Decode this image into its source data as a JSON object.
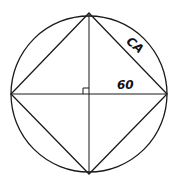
{
  "diagram": {
    "circle": {
      "cx": 89,
      "cy": 94,
      "r": 78
    },
    "vertices": {
      "top": [
        89,
        13
      ],
      "right": [
        167,
        94
      ],
      "bottom": [
        89,
        174
      ],
      "left": [
        11,
        94
      ]
    },
    "labels": {
      "side": "CA",
      "radius": "60"
    },
    "right_angle_marker": true,
    "stroke_color": "#1a1a1a"
  }
}
